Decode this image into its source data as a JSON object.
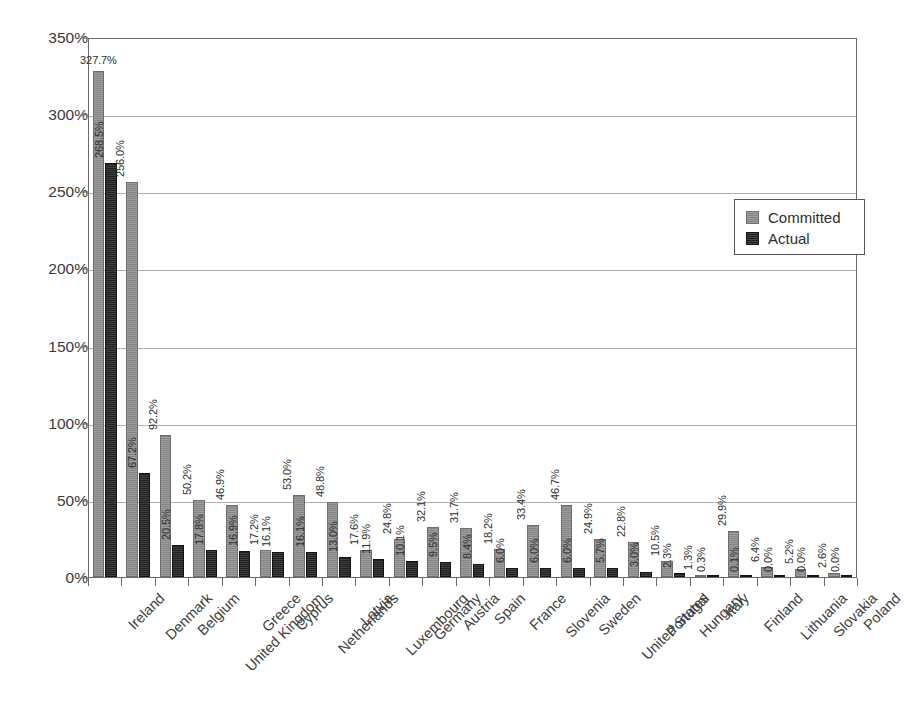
{
  "chart_data": {
    "type": "bar",
    "title": "",
    "subtitle": "",
    "xlabel": "",
    "ylabel": "",
    "ylim": [
      0,
      350
    ],
    "y_tick_labels": [
      "0%",
      "50%",
      "100%",
      "150%",
      "200%",
      "250%",
      "300%",
      "350%"
    ],
    "y_tick_values": [
      0,
      50,
      100,
      150,
      200,
      250,
      300,
      350
    ],
    "grid": true,
    "grid_axis": "y",
    "legend_position": "upper right",
    "value_suffix": "%",
    "categories": [
      "Ireland",
      "Denmark",
      "Belgium",
      "United Kingdom",
      "Greece",
      "Cyprus",
      "Netherlands",
      "Latvia",
      "Luxembourg",
      "Germany",
      "Austria",
      "Spain",
      "France",
      "Slovenia",
      "Sweden",
      "United States",
      "Portugal",
      "Hungary",
      "Italy",
      "Finland",
      "Lithuania",
      "Slovakia",
      "Poland"
    ],
    "series": [
      {
        "name": "Committed",
        "color": "#8c8c8c",
        "values": [
          327.7,
          256.0,
          92.2,
          50.2,
          46.9,
          17.2,
          53.0,
          48.8,
          17.6,
          24.8,
          32.1,
          31.7,
          18.2,
          33.4,
          46.7,
          24.9,
          22.8,
          10.5,
          1.3,
          29.9,
          6.4,
          5.2,
          2.6
        ],
        "labels": [
          "327.7%",
          "256.0%",
          "92.2%",
          "50.2%",
          "46.9%",
          "17.2%",
          "53.0%",
          "48.8%",
          "17.6%",
          "24.8%",
          "32.1%",
          "31.7%",
          "18.2%",
          "33.4%",
          "46.7%",
          "24.9%",
          "22.8%",
          "10.5%",
          "1.3%",
          "29.9%",
          "6.4%",
          "5.2%",
          "2.6%"
        ]
      },
      {
        "name": "Actual",
        "color": "#262626",
        "values": [
          268.5,
          67.2,
          20.5,
          17.8,
          16.9,
          16.1,
          16.1,
          13.0,
          11.9,
          10.1,
          9.5,
          8.4,
          6.0,
          6.0,
          6.0,
          5.7,
          3.0,
          2.3,
          0.3,
          0.1,
          0.0,
          0.0,
          0.0
        ],
        "labels": [
          "268.5%",
          "67.2%",
          "20.5%",
          "17.8%",
          "16.9%",
          "16.1%",
          "16.1%",
          "13.0%",
          "11.9%",
          "10.1%",
          "9.5%",
          "8.4%",
          "6.0%",
          "6.0%",
          "6.0%",
          "5.7%",
          "3.0%",
          "2.3%",
          "0.3%",
          "0.1%",
          "0.0%",
          "0.0%",
          "0.0%"
        ]
      }
    ]
  },
  "legend": {
    "entries": [
      {
        "label": "Committed",
        "swatch": "committed"
      },
      {
        "label": "Actual",
        "swatch": "actual"
      }
    ]
  }
}
